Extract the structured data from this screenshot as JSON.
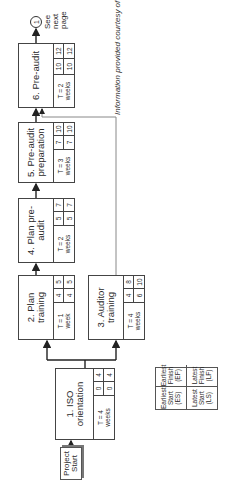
{
  "diagram": {
    "start_node": "Project\nStart",
    "tasks": [
      {
        "id": 1,
        "label": "1. ISO orientation",
        "duration": "T = 4",
        "unit": "weeks",
        "es": "0",
        "ef": "4",
        "ls": "0",
        "lf": "4"
      },
      {
        "id": 2,
        "label": "2. Plan training",
        "duration": "T = 1",
        "unit": "week",
        "es": "4",
        "ef": "5",
        "ls": "4",
        "lf": "5"
      },
      {
        "id": 3,
        "label": "3. Auditor training",
        "duration": "T = 4",
        "unit": "weeks",
        "es": "4",
        "ef": "8",
        "ls": "6",
        "lf": "10"
      },
      {
        "id": 4,
        "label": "4. Plan pre-audit",
        "duration": "T = 2",
        "unit": "weeks",
        "es": "5",
        "ef": "7",
        "ls": "5",
        "lf": "7"
      },
      {
        "id": 5,
        "label": "5. Pre-audit preparation",
        "duration": "T = 3",
        "unit": "weeks",
        "es": "7",
        "ef": "10",
        "ls": "7",
        "lf": "10"
      },
      {
        "id": 6,
        "label": "6. Pre-audit",
        "duration": "T = 2",
        "unit": "weeks",
        "es": "10",
        "ef": "12",
        "ls": "10",
        "lf": "12"
      }
    ],
    "edges": [
      {
        "from": "start",
        "to": 1
      },
      {
        "from": 1,
        "to": 2
      },
      {
        "from": 1,
        "to": 3
      },
      {
        "from": 2,
        "to": 4
      },
      {
        "from": 4,
        "to": 5
      },
      {
        "from": 5,
        "to": 6
      },
      {
        "from": 3,
        "to": 6
      },
      {
        "from": 6,
        "to": "connector-1"
      }
    ],
    "connector": {
      "label": "1",
      "note": "See\nnext\npage"
    },
    "legend": {
      "es": "Earliest\nStart\n(ES)",
      "ef": "Earliest\nFinish\n(EF)",
      "ls": "Latest\nStart\n(LS)",
      "lf": "Latest\nFinish\n(LF)"
    },
    "credit": "Information provided courtesy of BGP"
  }
}
